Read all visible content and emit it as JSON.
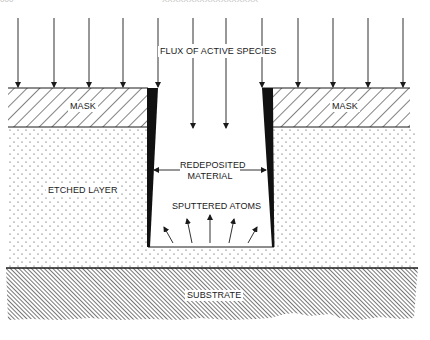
{
  "page_header": {
    "page_number": "000",
    "running_title": "XXXXXXXXXXXXXXXXXX"
  },
  "diagram": {
    "labels": {
      "flux": "FLUX OF ACTIVE SPECIES",
      "mask_left": "MASK",
      "mask_right": "MASK",
      "redeposited_line1": "REDEPOSITED",
      "redeposited_line2": "MATERIAL",
      "etched_layer": "ETCHED LAYER",
      "sputtered_atoms": "SPUTTERED ATOMS",
      "substrate": "SUBSTRATE"
    },
    "flux_arrows_x": [
      18,
      54,
      89,
      123,
      158,
      193,
      226,
      262,
      298,
      333,
      368,
      403
    ],
    "colors": {
      "ink": "#1a1a1a",
      "background": "#ffffff",
      "redeposit_fill": "#111111"
    }
  }
}
